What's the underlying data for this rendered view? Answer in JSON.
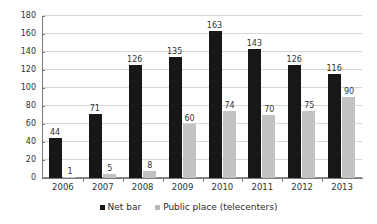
{
  "chart_data": {
    "type": "bar",
    "title": "",
    "subtitle": "",
    "xlabel": "",
    "ylabel": "",
    "categories": [
      "2006",
      "2007",
      "2008",
      "2009",
      "2010",
      "2011",
      "2012",
      "2013"
    ],
    "series": [
      {
        "name": "Net bar",
        "color": "#171717",
        "values": [
          44,
          71,
          126,
          135,
          163,
          143,
          126,
          116
        ]
      },
      {
        "name": "Public place (telecenters)",
        "color": "#c2c2c2",
        "values": [
          1,
          5,
          8,
          60,
          74,
          70,
          75,
          90
        ]
      }
    ],
    "ylim": [
      0,
      180
    ],
    "yticks": [
      0,
      20,
      40,
      60,
      80,
      100,
      120,
      140,
      160,
      180
    ],
    "ytick_labels": [
      "0",
      "20",
      "40",
      "60",
      "80",
      "100",
      "120",
      "140",
      "160",
      "180"
    ],
    "grid": true,
    "grid_axis": "y",
    "data_labels": true,
    "legend_position": "bottom"
  },
  "legend": {
    "items": [
      {
        "label": "Net bar",
        "swatch": "net"
      },
      {
        "label": "Public place (telecenters)",
        "swatch": "pub"
      }
    ]
  }
}
